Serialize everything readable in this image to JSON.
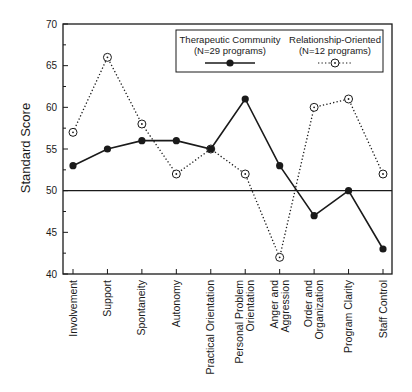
{
  "chart_data": {
    "type": "line",
    "title": "",
    "xlabel": "",
    "ylabel": "Standard Score",
    "ylim": [
      40,
      70
    ],
    "yticks": [
      40,
      45,
      50,
      55,
      60,
      65,
      70
    ],
    "reference_line": 50,
    "grid": false,
    "legend_position": "top-right inside",
    "categories": [
      "Involvement",
      "Support",
      "Spontaneity",
      "Autonomy",
      "Practical Orientation",
      "Personal Problem Orientation",
      "Anger and Aggression",
      "Order and Organization",
      "Program Clarity",
      "Staff Control"
    ],
    "category_lines": [
      [
        "Involvement"
      ],
      [
        "Support"
      ],
      [
        "Spontaneity"
      ],
      [
        "Autonomy"
      ],
      [
        "Practical Orientation"
      ],
      [
        "Personal Problem",
        "Orientation"
      ],
      [
        "Anger and",
        "Aggression"
      ],
      [
        "Order and",
        "Organization"
      ],
      [
        "Program Clarity"
      ],
      [
        "Staff Control"
      ]
    ],
    "series": [
      {
        "name": "Therapeutic Community",
        "subtitle": "(N=29 programs)",
        "style": "solid",
        "marker": "filled-circle",
        "color": "#1a1a1a",
        "values": [
          53,
          55,
          56,
          56,
          55,
          61,
          53,
          47,
          50,
          43
        ]
      },
      {
        "name": "Relationship-Oriented",
        "subtitle": "(N=12 programs)",
        "style": "dotted",
        "marker": "open-circle-dot",
        "color": "#1a1a1a",
        "values": [
          57,
          66,
          58,
          52,
          55,
          52,
          42,
          60,
          61,
          52
        ]
      }
    ]
  }
}
